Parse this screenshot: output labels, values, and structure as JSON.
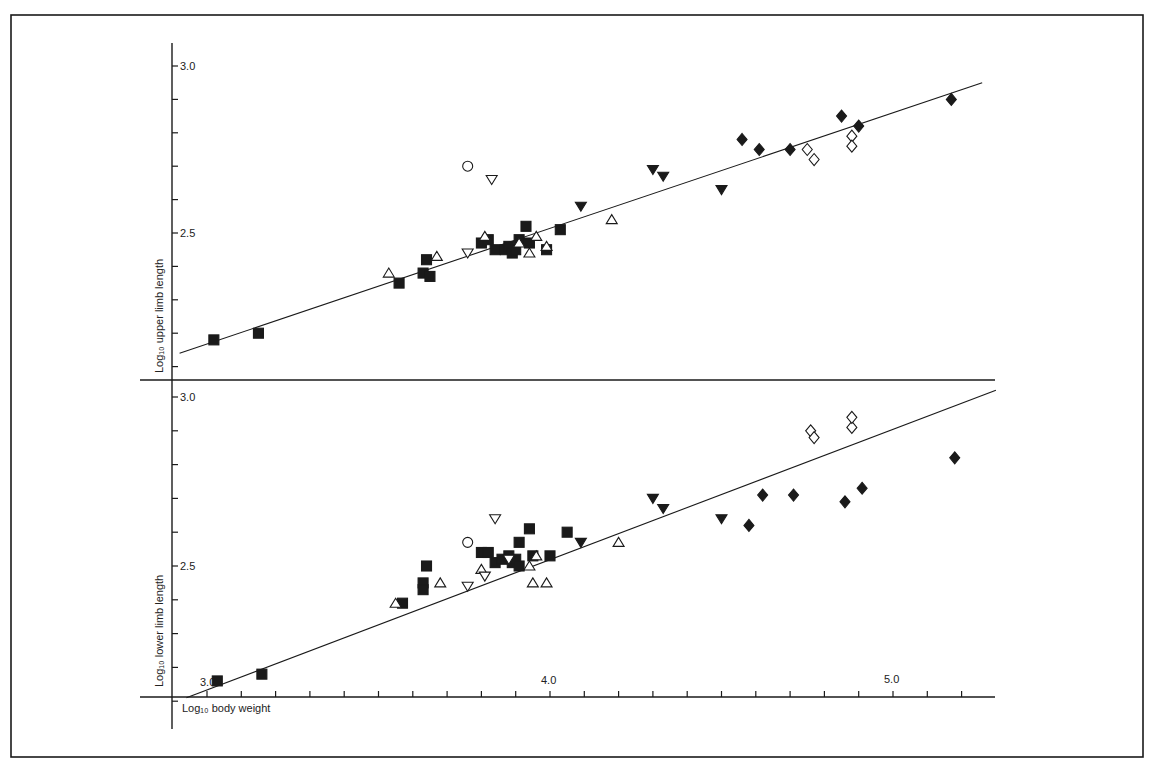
{
  "figure": {
    "upper_ylabel": "Log₁₀ upper limb length",
    "lower_ylabel": "Log₁₀ lower limb length",
    "xlabel": "Log₁₀ body weight",
    "ink_color": "#1a1a1a"
  },
  "chart_data": [
    {
      "type": "scatter",
      "title": "",
      "xlabel": "Log10 body weight",
      "ylabel": "Log10 upper limb length",
      "xlim": [
        2.95,
        5.27
      ],
      "ylim": [
        2.05,
        3.05
      ],
      "x_ticks": [
        3.0,
        4.0,
        5.0
      ],
      "x_tick_labels": [
        "3.0",
        "4.0",
        "5.0"
      ],
      "y_ticks": [
        2.5,
        3.0
      ],
      "y_tick_labels": [
        "2.5",
        "3.0"
      ],
      "grid": false,
      "regression_line": {
        "x": [
          2.92,
          5.26
        ],
        "y": [
          2.14,
          2.95
        ]
      },
      "series": [
        {
          "name": "filled-square",
          "marker": "square",
          "filled": true,
          "points": [
            [
              3.02,
              2.18
            ],
            [
              3.15,
              2.2
            ],
            [
              3.56,
              2.35
            ],
            [
              3.63,
              2.38
            ],
            [
              3.64,
              2.42
            ],
            [
              3.65,
              2.37
            ],
            [
              3.8,
              2.47
            ],
            [
              3.82,
              2.48
            ],
            [
              3.84,
              2.45
            ],
            [
              3.87,
              2.45
            ],
            [
              3.88,
              2.46
            ],
            [
              3.89,
              2.44
            ],
            [
              3.91,
              2.48
            ],
            [
              3.9,
              2.45
            ],
            [
              3.93,
              2.52
            ],
            [
              3.94,
              2.47
            ],
            [
              3.99,
              2.45
            ],
            [
              4.03,
              2.51
            ]
          ]
        },
        {
          "name": "open-triangle",
          "marker": "triangle-up",
          "filled": false,
          "points": [
            [
              3.53,
              2.38
            ],
            [
              3.67,
              2.43
            ],
            [
              3.81,
              2.49
            ],
            [
              3.91,
              2.47
            ],
            [
              3.94,
              2.44
            ],
            [
              3.99,
              2.46
            ],
            [
              4.18,
              2.54
            ],
            [
              3.96,
              2.49
            ]
          ]
        },
        {
          "name": "open-inverted-triangle",
          "marker": "triangle-down",
          "filled": false,
          "points": [
            [
              3.76,
              2.44
            ],
            [
              3.83,
              2.66
            ]
          ]
        },
        {
          "name": "open-circle",
          "marker": "circle",
          "filled": false,
          "points": [
            [
              3.76,
              2.7
            ]
          ]
        },
        {
          "name": "filled-inverted-triangle",
          "marker": "triangle-down",
          "filled": true,
          "points": [
            [
              4.09,
              2.58
            ],
            [
              4.3,
              2.69
            ],
            [
              4.33,
              2.67
            ],
            [
              4.5,
              2.63
            ]
          ]
        },
        {
          "name": "filled-diamond",
          "marker": "diamond",
          "filled": true,
          "points": [
            [
              4.56,
              2.78
            ],
            [
              4.61,
              2.75
            ],
            [
              4.7,
              2.75
            ],
            [
              4.85,
              2.85
            ],
            [
              4.9,
              2.82
            ],
            [
              5.17,
              2.9
            ]
          ]
        },
        {
          "name": "open-diamond",
          "marker": "diamond",
          "filled": false,
          "points": [
            [
              4.75,
              2.75
            ],
            [
              4.77,
              2.72
            ],
            [
              4.88,
              2.79
            ],
            [
              4.88,
              2.76
            ]
          ]
        }
      ]
    },
    {
      "type": "scatter",
      "title": "",
      "xlabel": "Log10 body weight",
      "ylabel": "Log10 lower limb length",
      "xlim": [
        2.95,
        5.27
      ],
      "ylim": [
        2.0,
        3.05
      ],
      "x_ticks": [
        3.0,
        4.0,
        5.0
      ],
      "x_tick_labels": [
        "3.0",
        "4.0",
        "5.0"
      ],
      "y_ticks": [
        2.5,
        3.0
      ],
      "y_tick_labels": [
        "2.5",
        "3.0"
      ],
      "grid": false,
      "regression_line": {
        "x": [
          2.94,
          5.3
        ],
        "y": [
          2.11,
          3.02
        ]
      },
      "series": [
        {
          "name": "filled-square",
          "marker": "square",
          "filled": true,
          "points": [
            [
              3.03,
              2.16
            ],
            [
              3.16,
              2.18
            ],
            [
              3.57,
              2.39
            ],
            [
              3.63,
              2.45
            ],
            [
              3.64,
              2.5
            ],
            [
              3.63,
              2.43
            ],
            [
              3.8,
              2.54
            ],
            [
              3.82,
              2.54
            ],
            [
              3.84,
              2.51
            ],
            [
              3.86,
              2.52
            ],
            [
              3.88,
              2.53
            ],
            [
              3.89,
              2.51
            ],
            [
              3.9,
              2.52
            ],
            [
              3.91,
              2.57
            ],
            [
              3.94,
              2.61
            ],
            [
              3.95,
              2.53
            ],
            [
              4.0,
              2.53
            ],
            [
              4.05,
              2.6
            ],
            [
              3.91,
              2.5
            ]
          ]
        },
        {
          "name": "open-triangle",
          "marker": "triangle-up",
          "filled": false,
          "points": [
            [
              3.55,
              2.39
            ],
            [
              3.68,
              2.45
            ],
            [
              3.8,
              2.49
            ],
            [
              3.94,
              2.5
            ],
            [
              3.95,
              2.45
            ],
            [
              3.99,
              2.45
            ],
            [
              4.2,
              2.57
            ],
            [
              3.96,
              2.53
            ]
          ]
        },
        {
          "name": "open-inverted-triangle",
          "marker": "triangle-down",
          "filled": false,
          "points": [
            [
              3.76,
              2.44
            ],
            [
              3.81,
              2.47
            ],
            [
              3.84,
              2.64
            ],
            [
              3.88,
              2.52
            ]
          ]
        },
        {
          "name": "open-circle",
          "marker": "circle",
          "filled": false,
          "points": [
            [
              3.76,
              2.57
            ]
          ]
        },
        {
          "name": "filled-inverted-triangle",
          "marker": "triangle-down",
          "filled": true,
          "points": [
            [
              4.09,
              2.57
            ],
            [
              4.3,
              2.7
            ],
            [
              4.33,
              2.67
            ],
            [
              4.5,
              2.64
            ]
          ]
        },
        {
          "name": "filled-diamond",
          "marker": "diamond",
          "filled": true,
          "points": [
            [
              4.58,
              2.62
            ],
            [
              4.62,
              2.71
            ],
            [
              4.71,
              2.71
            ],
            [
              4.86,
              2.69
            ],
            [
              4.91,
              2.73
            ],
            [
              5.18,
              2.82
            ]
          ]
        },
        {
          "name": "open-diamond",
          "marker": "diamond",
          "filled": false,
          "points": [
            [
              4.76,
              2.9
            ],
            [
              4.77,
              2.88
            ],
            [
              4.88,
              2.91
            ],
            [
              4.88,
              2.94
            ]
          ]
        }
      ]
    }
  ]
}
